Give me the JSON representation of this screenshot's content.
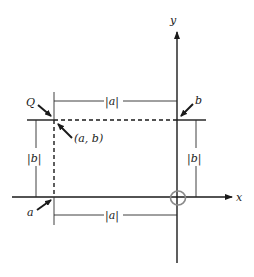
{
  "diagram": {
    "axes": {
      "x_label": "x",
      "y_label": "y"
    },
    "point": {
      "name": "Q",
      "coordinates": "(a, b)"
    },
    "pointer_labels": {
      "a": "a",
      "b": "b"
    },
    "dimensions": {
      "top_width": "|a|",
      "bottom_width": "|a|",
      "left_height": "|b|",
      "right_height": "|b|"
    },
    "colors": {
      "ink": "#1a1a1a",
      "origin_mark": "#8a8a8a",
      "background": "#ffffff"
    }
  }
}
